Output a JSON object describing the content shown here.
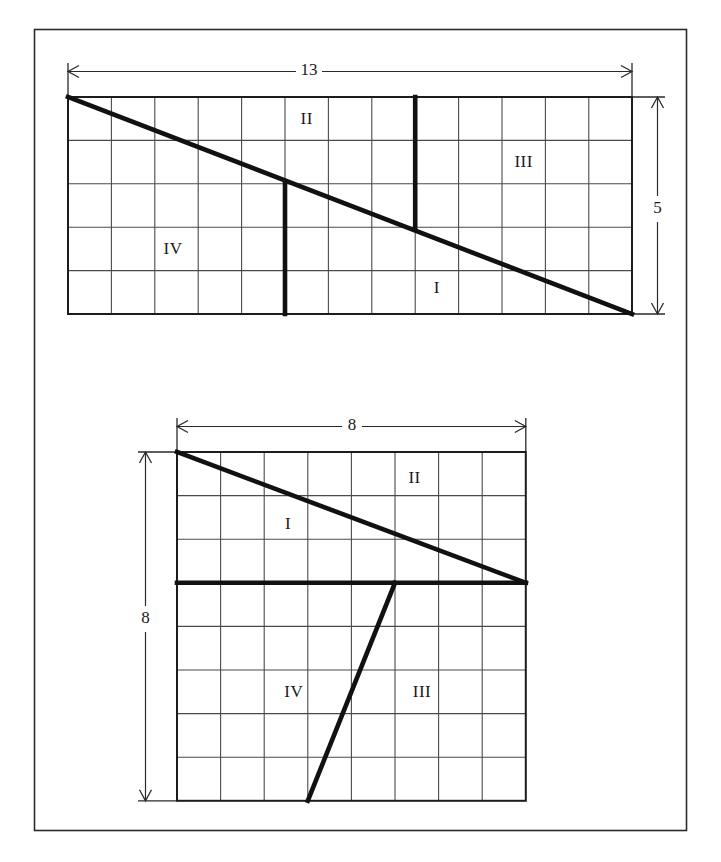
{
  "figure": {
    "caption": "",
    "background_color": "#ffffff",
    "line_color": "#111111",
    "grid_color": "#4a4a4a",
    "frame": {
      "x": 34,
      "y": 29,
      "width": 653,
      "height": 802
    }
  },
  "top_figure": {
    "name": "rectangle-13-by-5",
    "grid": {
      "x": 68,
      "y": 97,
      "cols": 13,
      "rows": 5,
      "cell": 43.4
    },
    "width_label": "13",
    "height_label": "5",
    "diagonal": {
      "from": [
        0,
        0
      ],
      "to": [
        13,
        5
      ]
    },
    "cuts": [
      {
        "name": "bold-vertical-at-x5",
        "from": [
          5,
          2
        ],
        "to": [
          5,
          5
        ]
      },
      {
        "name": "bold-vertical-at-x8",
        "from": [
          8,
          0
        ],
        "to": [
          8,
          3
        ]
      }
    ],
    "pieces": [
      {
        "label": "II",
        "gx": 5.5,
        "gy": 0.52
      },
      {
        "label": "III",
        "gx": 10.5,
        "gy": 1.52
      },
      {
        "label": "IV",
        "gx": 2.42,
        "gy": 3.52
      },
      {
        "label": "I",
        "gx": 8.5,
        "gy": 4.42
      }
    ]
  },
  "bottom_figure": {
    "name": "square-8-by-8",
    "grid": {
      "x": 177,
      "y": 452,
      "cols": 8,
      "rows": 8,
      "cell": 43.6
    },
    "width_label": "8",
    "height_label": "8",
    "diagonal": {
      "from": [
        0,
        0
      ],
      "to": [
        8,
        3
      ]
    },
    "cuts": [
      {
        "name": "bold-horizontal-at-y3",
        "from": [
          0,
          3
        ],
        "to": [
          8,
          3
        ]
      },
      {
        "name": "bold-slant",
        "from": [
          5,
          3
        ],
        "to": [
          3,
          8
        ]
      }
    ],
    "pieces": [
      {
        "label": "II",
        "gx": 5.45,
        "gy": 0.62
      },
      {
        "label": "I",
        "gx": 2.55,
        "gy": 1.68
      },
      {
        "label": "IV",
        "gx": 2.68,
        "gy": 5.52
      },
      {
        "label": "III",
        "gx": 5.62,
        "gy": 5.52
      }
    ]
  },
  "dimensions": {
    "top_width": "13",
    "top_height": "5",
    "bottom_width": "8",
    "bottom_height": "8"
  }
}
